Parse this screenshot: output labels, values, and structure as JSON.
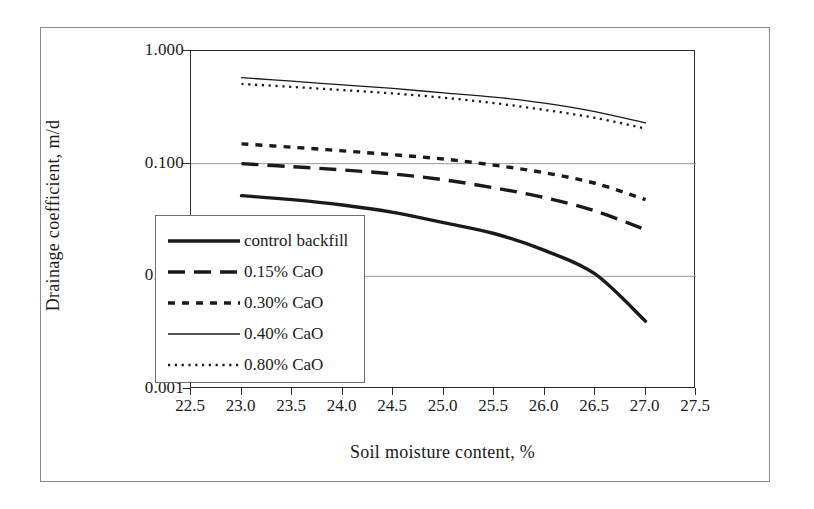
{
  "chart_data": {
    "type": "line",
    "title": "",
    "xlabel": "Soil moisture content,  %",
    "ylabel": "Drainage coefficient,  m/d",
    "xlim": [
      22.5,
      27.5
    ],
    "ylim": [
      0.001,
      1.0
    ],
    "yscale": "log",
    "xticks": [
      "22.5",
      "23.0",
      "23.5",
      "24.0",
      "24.5",
      "25.0",
      "25.5",
      "26.0",
      "26.5",
      "27.0",
      "27.5"
    ],
    "yticks": [
      "1.000",
      "0.100",
      "0.010",
      "0.001"
    ],
    "grid": "horizontal-major",
    "legend_position": "inner-left",
    "x": [
      23.0,
      23.5,
      24.0,
      24.5,
      25.0,
      25.5,
      26.0,
      26.5,
      27.0
    ],
    "series": [
      {
        "name": "control backfill",
        "style": "solid-thick",
        "values": [
          0.052,
          0.048,
          0.043,
          0.037,
          0.03,
          0.024,
          0.017,
          0.0105,
          0.004
        ]
      },
      {
        "name": "0.15% CaO",
        "style": "dashed-long",
        "values": [
          0.1,
          0.094,
          0.088,
          0.081,
          0.072,
          0.061,
          0.05,
          0.038,
          0.026
        ]
      },
      {
        "name": "0.30% CaO",
        "style": "dashed-short",
        "values": [
          0.15,
          0.14,
          0.13,
          0.12,
          0.11,
          0.097,
          0.083,
          0.067,
          0.048
        ]
      },
      {
        "name": "0.40% CaO",
        "style": "solid-thin",
        "values": [
          0.58,
          0.54,
          0.5,
          0.465,
          0.425,
          0.39,
          0.345,
          0.29,
          0.23
        ]
      },
      {
        "name": "0.80% CaO",
        "style": "dotted",
        "values": [
          0.51,
          0.48,
          0.45,
          0.42,
          0.385,
          0.345,
          0.3,
          0.255,
          0.205
        ]
      }
    ]
  },
  "legend": {
    "items": [
      {
        "label": "control backfill",
        "style": "solid-thick"
      },
      {
        "label": "0.15% CaO",
        "style": "dashed-long"
      },
      {
        "label": "0.30% CaO",
        "style": "dashed-short"
      },
      {
        "label": "0.40% CaO",
        "style": "solid-thin"
      },
      {
        "label": "0.80% CaO",
        "style": "dotted"
      }
    ]
  },
  "colors": {
    "ink": "#1a1a1a",
    "axis": "#2b2b2b",
    "grid": "#9a9a9a",
    "frame": "#8a8a8a",
    "background": "#ffffff"
  }
}
